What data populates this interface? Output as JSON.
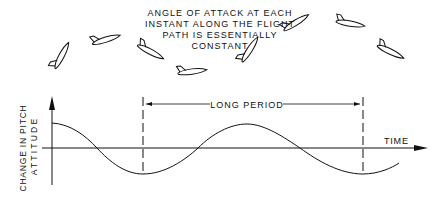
{
  "caption": {
    "lines": [
      "ANGLE OF ATTACK AT EACH",
      "INSTANT ALONG THE FLIGHT",
      "PATH IS ESSENTIALLY",
      "CONSTANT"
    ]
  },
  "axes": {
    "y_label_line1": "CHANGE IN PITCH",
    "y_label_line2": "ATTITUDE",
    "x_label": "TIME"
  },
  "annotation": {
    "period_label": "LONG PERIOD"
  },
  "colors": {
    "line": "#111111",
    "background": "#ffffff"
  },
  "aircraft": [
    {
      "x": 62,
      "y": 56,
      "angle": -60
    },
    {
      "x": 106,
      "y": 40,
      "angle": -15
    },
    {
      "x": 150,
      "y": 52,
      "angle": 30
    },
    {
      "x": 192,
      "y": 72,
      "angle": -5
    },
    {
      "x": 250,
      "y": 50,
      "angle": -55
    },
    {
      "x": 296,
      "y": 23,
      "angle": -30
    },
    {
      "x": 350,
      "y": 24,
      "angle": 12
    },
    {
      "x": 390,
      "y": 52,
      "angle": 28
    }
  ]
}
